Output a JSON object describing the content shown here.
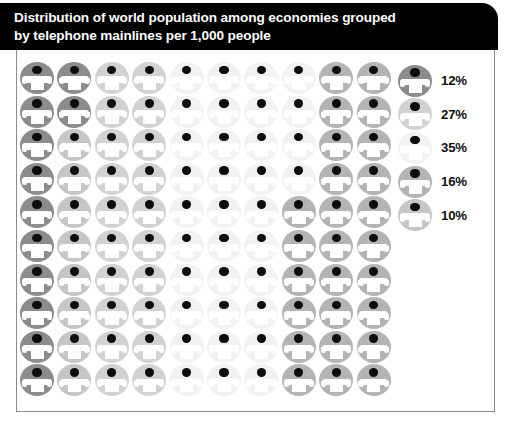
{
  "header": {
    "title": "Distribution of world population among economies grouped\nby telephone mainlines per 1,000 people"
  },
  "legend": {
    "items": [
      {
        "label": "12%",
        "tone": "#8c8c8c",
        "icon": "telephone-icon"
      },
      {
        "label": "27%",
        "tone": "#d2d2d2",
        "icon": "telephone-icon"
      },
      {
        "label": "35%",
        "tone": "#f2f2f2",
        "icon": "telephone-icon"
      },
      {
        "label": "16%",
        "tone": "#b4b4b4",
        "icon": "telephone-icon"
      },
      {
        "label": "10%",
        "tone": "#c6c6c6",
        "icon": "telephone-icon"
      }
    ]
  },
  "grid": {
    "rows": 10,
    "columns": 10,
    "total_icons": 100,
    "icon": "telephone-icon",
    "tones": {
      "a": "#8c8c8c",
      "b": "#d2d2d2",
      "c": "#f2f2f2",
      "d": "#b4b4b4",
      "e": "#c6c6c6"
    },
    "cells": [
      [
        "a",
        "a",
        "b",
        "b",
        "c",
        "c",
        "c",
        "c",
        "d",
        "d"
      ],
      [
        "a",
        "a",
        "b",
        "b",
        "c",
        "c",
        "c",
        "c",
        "d",
        "d"
      ],
      [
        "a",
        "e",
        "b",
        "b",
        "c",
        "c",
        "c",
        "c",
        "d",
        "d"
      ],
      [
        "a",
        "e",
        "b",
        "b",
        "c",
        "c",
        "c",
        "c",
        "d",
        "d"
      ],
      [
        "a",
        "e",
        "b",
        "b",
        "c",
        "c",
        "c",
        "d",
        "d",
        "d"
      ],
      [
        "a",
        "e",
        "b",
        "b",
        "c",
        "c",
        "c",
        "d",
        "d",
        "d"
      ],
      [
        "a",
        "e",
        "b",
        "b",
        "c",
        "c",
        "c",
        "d",
        "d",
        "d"
      ],
      [
        "a",
        "e",
        "b",
        "b",
        "c",
        "c",
        "c",
        "d",
        "d",
        "d"
      ],
      [
        "a",
        "e",
        "b",
        "b",
        "c",
        "c",
        "c",
        "d",
        "d",
        "d"
      ],
      [
        "a",
        "e",
        "b",
        "b",
        "c",
        "c",
        "c",
        "d",
        "d",
        "d"
      ]
    ]
  },
  "chart_data": {
    "type": "pie",
    "title": "Distribution of world population among economies grouped by telephone mainlines per 1,000 people",
    "xlabel": "",
    "ylabel": "",
    "categories": [
      "12%",
      "27%",
      "35%",
      "16%",
      "10%"
    ],
    "values": [
      12,
      27,
      35,
      16,
      10
    ],
    "unit": "percent of world population",
    "legend_position": "right",
    "grid": false
  }
}
